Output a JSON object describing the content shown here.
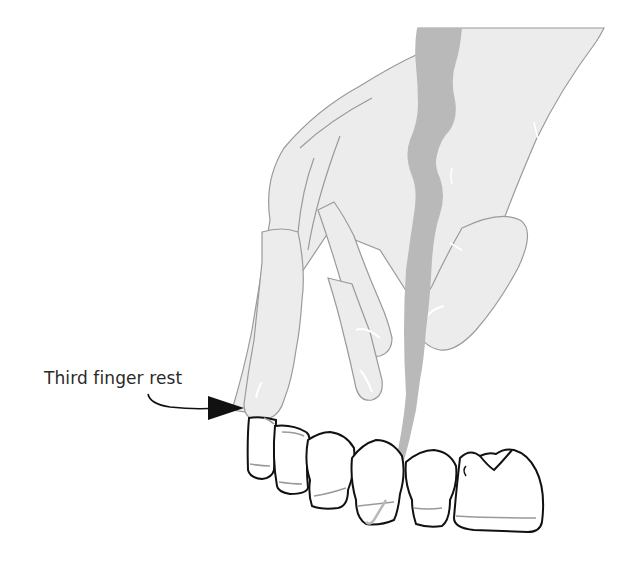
{
  "figure": {
    "label": {
      "text": "Third finger rest"
    },
    "colors": {
      "hand_fill": "#ececec",
      "hand_stroke": "#9a9a9a",
      "instrument_fill": "#b9b9b9",
      "tooth_stroke": "#111111",
      "gum_line": "#9a9a9a",
      "arrow": "#111111",
      "text": "#2a2a2a"
    },
    "teeth": [
      "lateral-incisor",
      "canine-1",
      "canine-2",
      "premolar-1",
      "premolar-2",
      "molar"
    ]
  }
}
